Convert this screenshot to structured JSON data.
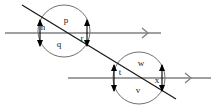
{
  "figure": {
    "type": "geometry-diagram",
    "background_color": "#ffffff",
    "parallel_line_color": "#808080",
    "transversal_color": "#1a1a1a",
    "circle_color": "#707070",
    "marker_color": "#000000",
    "label_color": "#1a1a1a"
  },
  "lines": {
    "parallel_top": {
      "name": "upper parallel line",
      "x1": 5,
      "y1": 33,
      "x2": 161,
      "y2": 33,
      "arrow_x": 146,
      "arrow_y": 33
    },
    "parallel_bottom": {
      "name": "lower parallel line",
      "x1": 68,
      "y1": 78,
      "x2": 211,
      "y2": 78,
      "arrow_x": 189,
      "arrow_y": 78
    },
    "transversal": {
      "name": "transversal line",
      "x1": 22,
      "y1": 5,
      "x2": 176,
      "y2": 99
    }
  },
  "circles": [
    {
      "name": "upper-intersection-circle",
      "cx": 64,
      "cy": 31,
      "r": 26
    },
    {
      "name": "lower-intersection-circle",
      "cx": 139,
      "cy": 78,
      "r": 26
    }
  ],
  "intersections": [
    {
      "name": "upper-left-intersection",
      "x": 41,
      "y": 33
    },
    {
      "name": "upper-right-intersection",
      "x": 86,
      "y": 33
    },
    {
      "name": "lower-left-intersection",
      "x": 114,
      "y": 78
    },
    {
      "name": "lower-right-intersection",
      "x": 161,
      "y": 78
    }
  ],
  "angle_labels": [
    {
      "id": "p",
      "text": "p",
      "x": 66,
      "y": 21,
      "circle": "upper",
      "position": "top"
    },
    {
      "id": "n",
      "text": "n",
      "x": 43,
      "y": 28,
      "circle": "upper",
      "position": "left"
    },
    {
      "id": "q",
      "text": "q",
      "x": 59,
      "y": 45,
      "circle": "upper",
      "position": "bottom"
    },
    {
      "id": "r",
      "text": "r",
      "x": 82,
      "y": 39,
      "circle": "upper",
      "position": "right"
    },
    {
      "id": "w",
      "text": "w",
      "x": 141,
      "y": 64,
      "circle": "lower",
      "position": "top"
    },
    {
      "id": "t",
      "text": "t",
      "x": 120,
      "y": 73,
      "circle": "lower",
      "position": "left"
    },
    {
      "id": "v",
      "text": "v",
      "x": 138,
      "y": 91,
      "circle": "lower",
      "position": "bottom"
    },
    {
      "id": "x",
      "text": "x",
      "x": 157,
      "y": 81,
      "circle": "lower",
      "position": "right"
    }
  ],
  "angle_markers": [
    {
      "name": "marker-upper-left-up",
      "x": 40,
      "y": 33,
      "dir": "up"
    },
    {
      "name": "marker-upper-left-down",
      "x": 40,
      "y": 33,
      "dir": "down"
    },
    {
      "name": "marker-upper-right-up",
      "x": 87,
      "y": 33,
      "dir": "up"
    },
    {
      "name": "marker-upper-right-down",
      "x": 87,
      "y": 33,
      "dir": "down"
    },
    {
      "name": "marker-lower-left-up",
      "x": 114,
      "y": 78,
      "dir": "up"
    },
    {
      "name": "marker-lower-left-down",
      "x": 114,
      "y": 78,
      "dir": "down"
    },
    {
      "name": "marker-lower-right-up",
      "x": 162,
      "y": 78,
      "dir": "up"
    },
    {
      "name": "marker-lower-right-down",
      "x": 162,
      "y": 78,
      "dir": "down"
    }
  ]
}
